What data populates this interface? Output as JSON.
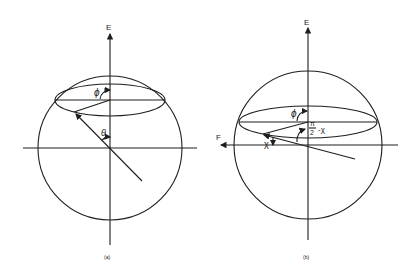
{
  "figure": {
    "panels": [
      {
        "id": "a",
        "caption": "(a)",
        "axis_label_vertical": "E",
        "angle_labels": {
          "azimuth": "ϕ",
          "polar": "θ"
        }
      },
      {
        "id": "b",
        "caption": "(b)",
        "axis_label_vertical": "E",
        "axis_label_horizontal": "F",
        "angle_labels": {
          "azimuth": "ϕ",
          "complement": "π/2 − χ",
          "complement_num": "π",
          "complement_den": "2",
          "complement_rest": "-χ",
          "chi": "χ"
        }
      }
    ]
  }
}
